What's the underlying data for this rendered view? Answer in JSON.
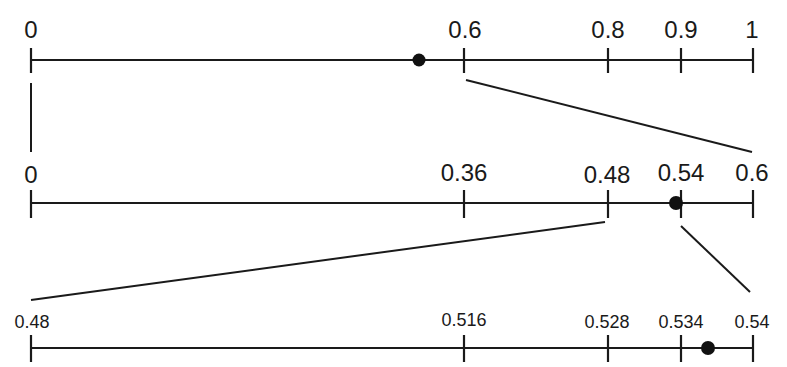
{
  "diagram": {
    "line_color": "#1a1a1a",
    "point_color": "#111111",
    "axes": [
      {
        "name": "axis-1",
        "range": [
          0,
          1
        ],
        "ticks": [
          {
            "value": 0,
            "label": "0"
          },
          {
            "value": 0.6,
            "label": "0.6"
          },
          {
            "value": 0.8,
            "label": "0.8"
          },
          {
            "value": 0.9,
            "label": "0.9"
          },
          {
            "value": 1,
            "label": "1"
          }
        ],
        "point": 0.54
      },
      {
        "name": "axis-2",
        "range": [
          0,
          0.6
        ],
        "ticks": [
          {
            "value": 0,
            "label": "0"
          },
          {
            "value": 0.36,
            "label": "0.36"
          },
          {
            "value": 0.48,
            "label": "0.48"
          },
          {
            "value": 0.54,
            "label": "0.54"
          },
          {
            "value": 0.6,
            "label": "0.6"
          }
        ],
        "point": 0.537
      },
      {
        "name": "axis-3",
        "range": [
          0.48,
          0.54
        ],
        "ticks": [
          {
            "value": 0.48,
            "label": "0.48"
          },
          {
            "value": 0.516,
            "label": "0.516"
          },
          {
            "value": 0.528,
            "label": "0.528"
          },
          {
            "value": 0.534,
            "label": "0.534"
          },
          {
            "value": 0.54,
            "label": "0.54"
          }
        ],
        "point": 0.5365
      }
    ],
    "zoom_connectors": [
      {
        "from": "axis-1 [0, 0.6]",
        "to": "axis-2 [0, 0.6]"
      },
      {
        "from": "axis-2 [0.48, 0.54]",
        "to": "axis-3 [0.48, 0.54]"
      }
    ]
  }
}
